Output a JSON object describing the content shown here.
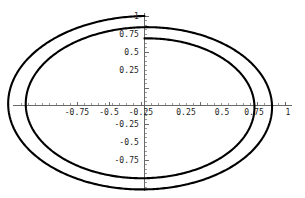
{
  "figure": {
    "title": "",
    "background_color": "#ffffff",
    "curve_color": "#000000",
    "axis_color": "#5a5a5a",
    "width_px": 305,
    "height_px": 198
  },
  "axes": {
    "x_tick_labels": [
      "-0.75",
      "-0.5",
      "-0.25",
      "0.25",
      "0.5",
      "0.75",
      "1"
    ],
    "y_tick_labels": [
      "1",
      "0.75",
      "0.5",
      "0.25",
      "-0.25",
      "-0.5",
      "-0.75"
    ],
    "x_tick_values": [
      -0.75,
      -0.5,
      -0.25,
      0.25,
      0.5,
      0.75,
      1
    ],
    "y_tick_values": [
      1,
      0.75,
      0.5,
      0.25,
      -0.25,
      -0.5,
      -0.75
    ],
    "x_minor_step": 0.05,
    "y_minor_step": 0.05,
    "xlabel": "",
    "ylabel": "",
    "grid": false,
    "origin_label": ""
  },
  "chart_data": {
    "type": "line",
    "title": "",
    "subtitle": "",
    "xlabel": "",
    "ylabel": "",
    "grid": false,
    "legend": [],
    "legend_position": "none",
    "xlim": [
      -1.04,
      1.04
    ],
    "ylim": [
      -1.02,
      1.02
    ],
    "xticks": [
      -0.75,
      -0.5,
      -0.25,
      0.25,
      0.5,
      0.75,
      1
    ],
    "xticklabels": [
      "-0.75",
      "-0.5",
      "-0.25",
      "0.25",
      "0.5",
      "0.75",
      "1"
    ],
    "yticks": [
      1,
      0.75,
      0.5,
      0.25,
      -0.25,
      -0.5,
      -0.75
    ],
    "yticklabels": [
      "1",
      "0.75",
      "0.5",
      "0.25",
      "-0.25",
      "-0.5",
      "-0.75"
    ],
    "parametric": {
      "theta_start_deg": 90,
      "theta_end_deg": 810,
      "r_start": 1.0,
      "r_end": 0.75,
      "x_formula": "r(t)*cos(t)",
      "y_formula": "r(t)*sin(t)",
      "turns": 2
    },
    "series": [
      {
        "name": "spiral",
        "color": "#000000",
        "linewidth": 2.1,
        "x": [
          0.0,
          -0.2554,
          -0.5091,
          -0.7147,
          -0.8588,
          -0.9258,
          -0.9132,
          -0.8248,
          -0.6695,
          -0.4623,
          -0.2224,
          0.0302,
          0.2752,
          0.493,
          0.6662,
          0.7815,
          0.8303,
          0.8101,
          0.7241,
          0.5815,
          0.3961,
          0.1855,
          -0.0309,
          -0.2355,
          -0.4093,
          -0.5373,
          -0.6087,
          -0.6182,
          -0.5667,
          -0.4603,
          -0.31,
          -0.1311,
          0.0574,
          0.2355,
          0.3843,
          0.4879,
          0.5348,
          0.5198,
          0.4442,
          0.3162,
          0.1498,
          -0.0359
        ],
        "y": [
          1.0,
          0.9614,
          0.867,
          0.7166,
          0.5191,
          0.2886,
          0.0434,
          -0.197,
          -0.4133,
          -0.588,
          -0.7066,
          -0.7593,
          -0.7424,
          -0.6584,
          -0.5163,
          -0.3306,
          -0.12,
          0.0954,
          0.2953,
          0.4607,
          0.5754,
          0.6274,
          0.6102,
          0.5234,
          0.3734,
          0.1726,
          -0.0607,
          -0.3059,
          -0.5389,
          -0.7341,
          -0.8657,
          -0.9081,
          -0.8519,
          -0.7117,
          -0.5062,
          -0.2571,
          0.0119,
          0.2802,
          0.5238,
          0.7195,
          0.8511,
          0.9104
        ]
      }
    ],
    "markers": [
      {
        "name": "outer-start",
        "x": 0.0,
        "y": 1.0,
        "label": ""
      },
      {
        "name": "inner-end",
        "x": 0.0,
        "y": -0.75,
        "label": ""
      }
    ],
    "crossings": {
      "x_axis_positive": [
        1.0,
        0.75
      ],
      "y_axis_positive": [
        1.0,
        0.875
      ],
      "x_axis_negative": [
        -0.9375,
        -0.6875
      ],
      "y_axis_negative": [
        -0.8125,
        -0.75
      ]
    }
  }
}
